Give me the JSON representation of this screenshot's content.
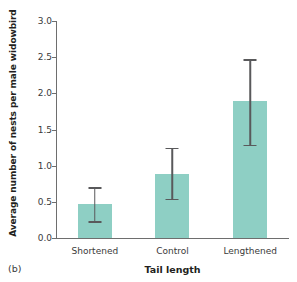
{
  "panel": {
    "label": "(b)"
  },
  "chart_data": {
    "type": "bar",
    "title": "",
    "subtitle": "",
    "xlabel": "Tail length",
    "ylabel": "Average number of nests per male widowbird",
    "categories": [
      "Shortened",
      "Control",
      "Lengthened"
    ],
    "values": [
      0.47,
      0.89,
      1.89
    ],
    "error_low": [
      0.23,
      0.54,
      1.29
    ],
    "error_high": [
      0.7,
      1.25,
      2.47
    ],
    "ylim": [
      0.0,
      3.0
    ],
    "yticks": [
      "0.0",
      "0.5",
      "1.0",
      "1.5",
      "2.0",
      "2.5",
      "3.0"
    ],
    "ytick_values": [
      0.0,
      0.5,
      1.0,
      1.5,
      2.0,
      2.5,
      3.0
    ],
    "grid": false,
    "legend": "none",
    "series": [
      {
        "name": "Average number of nests per male widowbird",
        "values": [
          0.47,
          0.89,
          1.89
        ]
      }
    ],
    "colors": {
      "bar_fill": "#8ecfc4",
      "axis": "#6e6e6e",
      "error_bar": "#59595b",
      "text": "#231f20"
    }
  }
}
